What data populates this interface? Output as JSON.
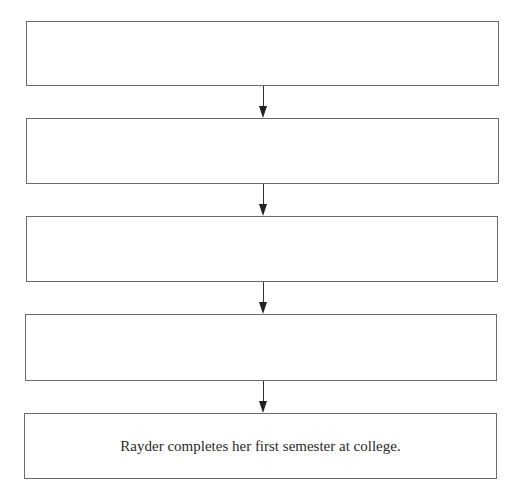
{
  "flowchart": {
    "boxes": [
      {
        "text": ""
      },
      {
        "text": ""
      },
      {
        "text": ""
      },
      {
        "text": ""
      },
      {
        "text": "Rayder completes her first semester at college."
      }
    ],
    "arrows": [
      {
        "from": 0,
        "to": 1
      },
      {
        "from": 1,
        "to": 2
      },
      {
        "from": 2,
        "to": 3
      },
      {
        "from": 3,
        "to": 4
      }
    ],
    "colors": {
      "border": "#6b6b6b",
      "arrow": "#222222",
      "text": "#2a2a2a",
      "background": "#ffffff"
    }
  }
}
